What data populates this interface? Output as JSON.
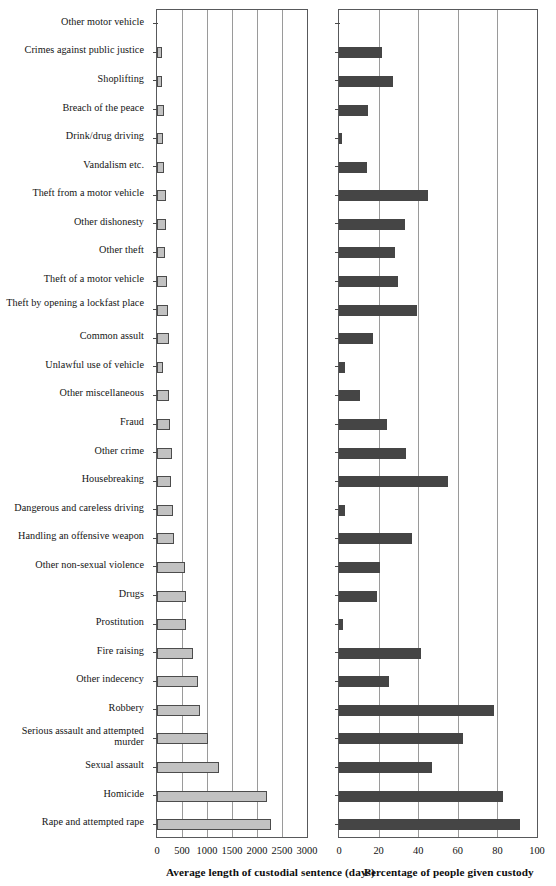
{
  "chart_data": {
    "type": "bar",
    "orientation": "horizontal",
    "title": "",
    "panels": [
      {
        "id": "panel-a",
        "xlabel": "Average length of custodial sentence (days)",
        "xlim": [
          0,
          3000
        ],
        "xticks": [
          0,
          500,
          1000,
          1500,
          2000,
          2500,
          3000
        ],
        "xticklabels": [
          "0",
          "500",
          "1000",
          "1500",
          "2000",
          "2500",
          "3000"
        ],
        "bar_color": "#c2c2c2",
        "grid": true
      },
      {
        "id": "panel-b",
        "xlabel": "Percentage of people given custody",
        "xlim": [
          0,
          100
        ],
        "xticks": [
          0,
          20,
          40,
          60,
          80,
          100
        ],
        "xticklabels": [
          "0",
          "20",
          "40",
          "60",
          "80",
          "100"
        ],
        "bar_color": "#454545",
        "grid": true
      }
    ],
    "categories": [
      "Other motor vehicle",
      "Crimes against public justice",
      "Shoplifting",
      "Breach of the peace",
      "Drink/drug driving",
      "Vandalism etc.",
      "Theft from a motor vehicle",
      "Other dishonesty",
      "Other theft",
      "Theft of a motor vehicle",
      "Theft by opening a lockfast place",
      "Common assult",
      "Unlawful use of vehicle",
      "Other miscellaneous",
      "Fraud",
      "Other crime",
      "Housebreaking",
      "Dangerous and careless driving",
      "Handling an offensive weapon",
      "Other non-sexual violence",
      "Drugs",
      "Prostitution",
      "Fire raising",
      "Other indecency",
      "Robbery",
      "Serious assault and attempted murder",
      "Sexual assault",
      "Homicide",
      "Rape and attempted rape"
    ],
    "series": [
      {
        "name": "Average length of custodial sentence (days)",
        "panel": "panel-a",
        "values": [
          0,
          90,
          97,
          130,
          123,
          143,
          170,
          175,
          162,
          195,
          227,
          234,
          110,
          247,
          260,
          305,
          273,
          318,
          338,
          550,
          578,
          578,
          727,
          812,
          857,
          1019,
          1234,
          2208,
          2273
        ]
      },
      {
        "name": "Percentage of people given custody",
        "panel": "panel-b",
        "values": [
          0,
          21.7,
          27.3,
          14.4,
          1.3,
          13.9,
          45.2,
          33.3,
          28.3,
          29.6,
          39.3,
          17.2,
          3.2,
          10.4,
          24.2,
          33.8,
          54.8,
          2.8,
          37.0,
          20.9,
          19.0,
          2.2,
          41.5,
          25.0,
          78.4,
          62.8,
          47.0,
          83.0,
          91.5
        ]
      }
    ]
  }
}
